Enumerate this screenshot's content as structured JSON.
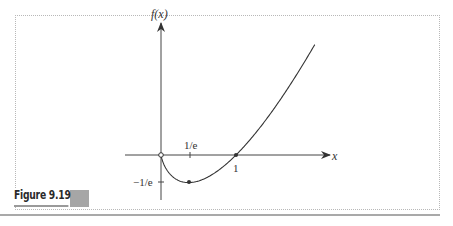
{
  "figure": {
    "label": "Figure 9.19",
    "accent_color": "#a6a6a6"
  },
  "chart_data": {
    "type": "line",
    "title": "",
    "function": "f(x) = x ln x",
    "xlabel": "x",
    "ylabel": "f(x)",
    "x_tick_labels": [
      "1/e",
      "1"
    ],
    "y_tick_labels": [
      "−1/e"
    ],
    "grid": false,
    "legend": null,
    "xlim": [
      -0.48,
      2.27
    ],
    "ylim": [
      -0.6,
      1.8
    ],
    "series": [
      {
        "name": "f(x)",
        "x": [
          0,
          0.05,
          0.1,
          0.2,
          0.3,
          0.3679,
          0.5,
          0.7,
          1.0,
          1.3,
          1.6,
          1.9,
          2.05
        ],
        "y": [
          0,
          -0.15,
          -0.23,
          -0.32,
          -0.36,
          -0.3679,
          -0.35,
          -0.25,
          0,
          0.34,
          0.75,
          1.22,
          1.47
        ]
      }
    ],
    "annotations": [
      {
        "type": "open-point",
        "x": 0,
        "y": 0
      },
      {
        "type": "closed-point",
        "x": 0.3679,
        "y": -0.3679,
        "label": "minimum (1/e, −1/e)"
      },
      {
        "type": "closed-point",
        "x": 1,
        "y": 0
      }
    ]
  },
  "labels": {
    "y_axis": "f(x)",
    "x_axis": "x",
    "tick_inv_e": "1/e",
    "tick_one": "1",
    "tick_neg_inv_e": "−1/e"
  }
}
